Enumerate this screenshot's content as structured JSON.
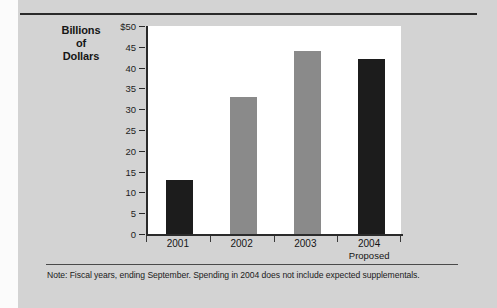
{
  "chart_data": {
    "type": "bar",
    "title": "Billions of Dollars",
    "title_lines": [
      "Billions",
      "of",
      "Dollars"
    ],
    "categories": [
      "2001",
      "2002",
      "2003",
      "2004"
    ],
    "category_sublabels": [
      "",
      "",
      "",
      "Proposed"
    ],
    "values": [
      13,
      33,
      44,
      42
    ],
    "series": [
      {
        "name": "Spending",
        "values": [
          13,
          33,
          44,
          42
        ],
        "colors": [
          "#1c1c1c",
          "#8a8a8a",
          "#8a8a8a",
          "#1c1c1c"
        ]
      }
    ],
    "xlabel": "",
    "ylabel": "Billions of Dollars",
    "ylim": [
      0,
      50
    ],
    "ytick_values": [
      0,
      5,
      10,
      15,
      20,
      25,
      30,
      35,
      40,
      45,
      50
    ],
    "ytick_labels": [
      "0",
      "5",
      "10",
      "15",
      "20",
      "25",
      "30",
      "35",
      "40",
      "45",
      "$50"
    ],
    "grid": false,
    "legend": false,
    "note": "Note:  Fiscal years, ending September. Spending in 2004 does not include expected supplementals."
  },
  "colors": {
    "page_background": "#d3d3d3",
    "plot_background": "#ffffff",
    "axis": "#2b2b2b",
    "bar_dark": "#1c1c1c",
    "bar_light": "#8a8a8a",
    "text": "#151515"
  }
}
